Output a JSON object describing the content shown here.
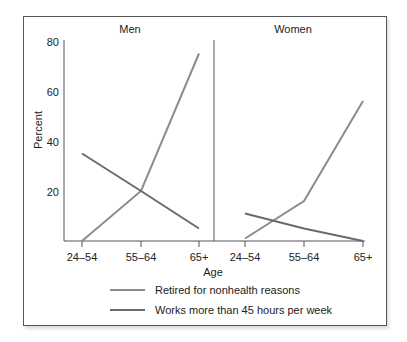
{
  "chart_data": [
    {
      "type": "line",
      "title": "Men",
      "categories": [
        "24–54",
        "55–64",
        "65+"
      ],
      "xlabel": "Age",
      "ylabel": "Percent",
      "ylim": [
        0,
        80
      ],
      "yticks": [
        20,
        40,
        60,
        80
      ],
      "series": [
        {
          "name": "Retired for nonhealth reasons",
          "values": [
            0,
            20,
            75
          ],
          "color": "#8c8c8c"
        },
        {
          "name": "Works more than 45 hours per week",
          "values": [
            35,
            20,
            5
          ],
          "color": "#6b6b6b"
        }
      ]
    },
    {
      "type": "line",
      "title": "Women",
      "categories": [
        "24–54",
        "55–64",
        "65+"
      ],
      "xlabel": "Age",
      "ylabel": "Percent",
      "ylim": [
        0,
        80
      ],
      "series": [
        {
          "name": "Retired for nonhealth reasons",
          "values": [
            1,
            16,
            56
          ],
          "color": "#8c8c8c"
        },
        {
          "name": "Works more than 45 hours per week",
          "values": [
            11,
            5,
            0
          ],
          "color": "#6b6b6b"
        }
      ]
    }
  ],
  "panels": {
    "men_title": "Men",
    "women_title": "Women"
  },
  "axis": {
    "ylabel": "Percent",
    "xlabel": "Age",
    "yticks": [
      "80",
      "60",
      "40",
      "20"
    ],
    "xticks": [
      "24–54",
      "55–64",
      "65+"
    ]
  },
  "legend": {
    "retired": "Retired for nonhealth reasons",
    "works": "Works more than 45 hours per week"
  }
}
